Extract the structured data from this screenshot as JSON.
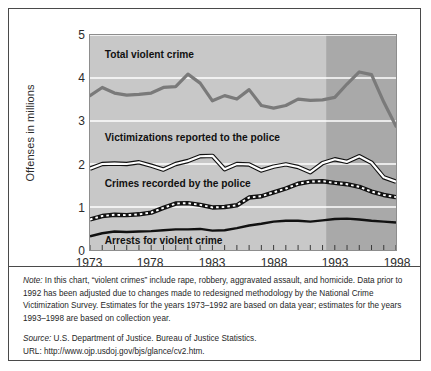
{
  "chart_data": {
    "type": "line",
    "title": "",
    "xlabel": "",
    "ylabel": "Offenses in millions",
    "xlim": [
      1973,
      1998
    ],
    "ylim": [
      0,
      5
    ],
    "grid": true,
    "legend": "inline-labels",
    "x": [
      1973,
      1974,
      1975,
      1976,
      1977,
      1978,
      1979,
      1980,
      1981,
      1982,
      1983,
      1984,
      1985,
      1986,
      1987,
      1988,
      1989,
      1990,
      1991,
      1992,
      1993,
      1994,
      1995,
      1996,
      1997,
      1998
    ],
    "xticks": [
      1973,
      1978,
      1983,
      1988,
      1993,
      1998
    ],
    "yticks": [
      0,
      1,
      2,
      3,
      4,
      5
    ],
    "shaded_region": {
      "label": "collection-year basis",
      "start": 1992.3,
      "end": 1998
    },
    "series": [
      {
        "name": "Total violent crime",
        "style": "thick-gray-line",
        "color": "#7a7a7a",
        "values": [
          3.59,
          3.78,
          3.65,
          3.6,
          3.62,
          3.65,
          3.78,
          3.8,
          4.09,
          3.88,
          3.47,
          3.59,
          3.51,
          3.73,
          3.36,
          3.3,
          3.36,
          3.51,
          3.48,
          3.49,
          3.55,
          3.86,
          4.14,
          4.08,
          3.44,
          2.88
        ]
      },
      {
        "name": "Victimizations reported to the police",
        "style": "white-line-black-outline",
        "color": "#ffffff",
        "values": [
          1.89,
          2.0,
          2.01,
          2.0,
          2.04,
          1.96,
          1.87,
          2.0,
          2.07,
          2.18,
          2.19,
          1.88,
          2.0,
          1.99,
          1.85,
          1.94,
          1.99,
          1.93,
          1.81,
          2.02,
          2.11,
          2.05,
          2.18,
          2.03,
          1.69,
          1.59
        ]
      },
      {
        "name": "Crimes recorded by the police",
        "style": "black-white-dashed",
        "color": "#111111",
        "values": [
          0.71,
          0.79,
          0.82,
          0.81,
          0.83,
          0.87,
          0.98,
          1.08,
          1.09,
          1.05,
          0.99,
          1.0,
          1.04,
          1.22,
          1.25,
          1.34,
          1.43,
          1.54,
          1.59,
          1.6,
          1.56,
          1.53,
          1.47,
          1.36,
          1.28,
          1.23
        ]
      },
      {
        "name": "Arrests for violent crime",
        "style": "solid-black-line",
        "color": "#111111",
        "values": [
          0.32,
          0.39,
          0.43,
          0.42,
          0.43,
          0.44,
          0.46,
          0.48,
          0.48,
          0.49,
          0.45,
          0.46,
          0.51,
          0.57,
          0.61,
          0.66,
          0.68,
          0.68,
          0.66,
          0.69,
          0.72,
          0.73,
          0.71,
          0.68,
          0.66,
          0.64
        ]
      }
    ],
    "inline_labels": [
      {
        "text": "Total violent crime",
        "x": 1974.2,
        "y": 4.46
      },
      {
        "text": "Victimizations reported to the police",
        "x": 1974.2,
        "y": 2.54
      },
      {
        "text": "Crimes recorded by the police",
        "x": 1974.2,
        "y": 1.46
      },
      {
        "text": "Arrests for violent crime",
        "x": 1974.2,
        "y": 0.13
      }
    ],
    "colors": {
      "plot_background_light": "#c8c8c8",
      "plot_background_dark": "#a9a9a9",
      "gridline": "#ffffff",
      "axis": "#8d8d8d",
      "frame_border": "#4a4a4a",
      "text": "#1f1f1f"
    }
  },
  "axis": {
    "y_title": "Offenses in millions",
    "y_ticks": [
      "5",
      "4",
      "3",
      "2",
      "1",
      "0"
    ],
    "x_ticks": [
      "1973",
      "1978",
      "1983",
      "1988",
      "1993",
      "1998"
    ]
  },
  "series_labels": {
    "total": "Total violent crime",
    "victimizations": "Victimizations reported to the police",
    "recorded": "Crimes recorded by the police",
    "arrests": "Arrests for violent crime"
  },
  "notes": {
    "note_prefix": "Note:",
    "note_body": " In this chart, “violent crimes” include rape, robbery, aggravated assault, and homicide. Data prior to 1992 has been adjusted due to changes made to redesigned methodology by the National Crime Victimization Survey. Estimates for the years 1973–1992 are based on data year; estimates for the years 1993–1998 are based on collection year.",
    "source_prefix": "Source:",
    "source_body": " U.S. Department of Justice. Bureau of Justice Statistics.",
    "url": "URL: http://www.ojp.usdoj.gov/bjs/glance/cv2.htm."
  }
}
